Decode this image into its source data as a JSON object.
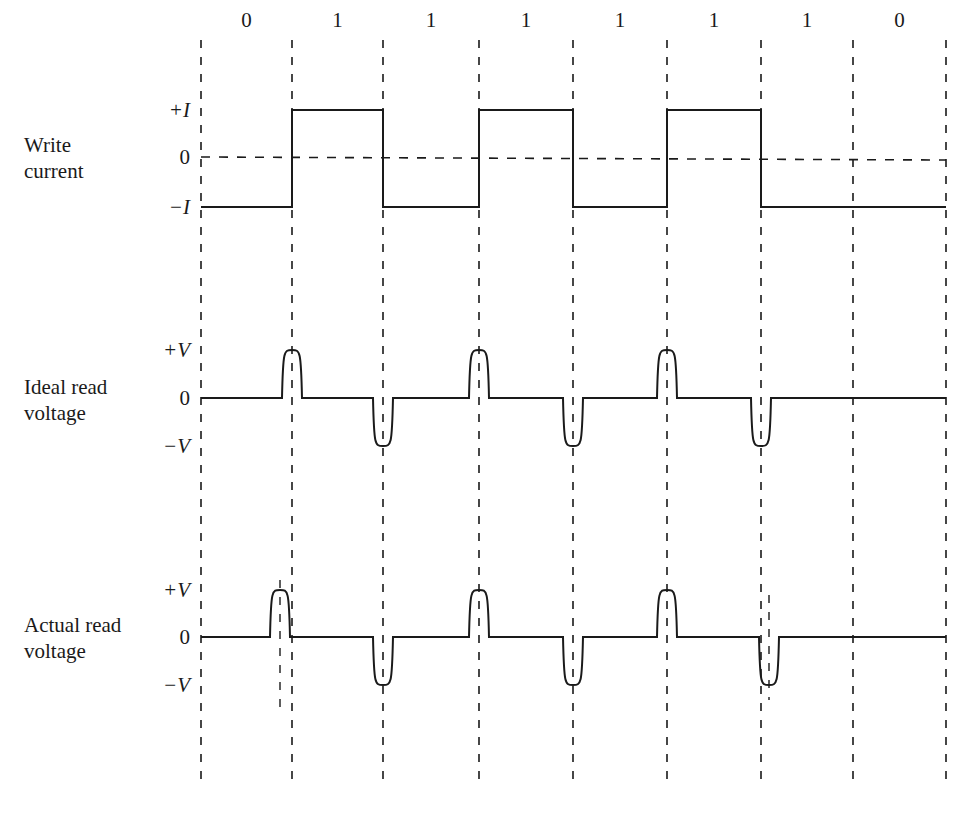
{
  "diagram": {
    "type": "timing-diagram",
    "bits": [
      "0",
      "1",
      "1",
      "1",
      "1",
      "1",
      "1",
      "0"
    ],
    "grid_x": [
      201,
      292,
      383,
      479,
      573,
      667,
      761,
      853,
      946
    ],
    "grid_top": 40,
    "grid_bottom": 780,
    "line_color": "#1a1a1a",
    "signals": [
      {
        "name_line1": "Write",
        "name_line2": "current",
        "levels": {
          "pos": "+I",
          "zero": "0",
          "neg": "−I"
        },
        "y": {
          "pos": 110,
          "zero": 157,
          "neg": 207
        },
        "states": [
          "neg",
          "pos",
          "neg",
          "pos",
          "neg",
          "pos",
          "neg",
          "neg"
        ]
      },
      {
        "name_line1": "Ideal read",
        "name_line2": "voltage",
        "levels": {
          "pos": "+V",
          "zero": "0",
          "neg": "−V"
        },
        "y": {
          "pos": 350,
          "zero": 398,
          "neg": 446
        },
        "pulses": [
          {
            "x": 292,
            "dir": "pos"
          },
          {
            "x": 383,
            "dir": "neg"
          },
          {
            "x": 479,
            "dir": "pos"
          },
          {
            "x": 573,
            "dir": "neg"
          },
          {
            "x": 667,
            "dir": "pos"
          },
          {
            "x": 761,
            "dir": "neg"
          }
        ]
      },
      {
        "name_line1": "Actual read",
        "name_line2": "voltage",
        "levels": {
          "pos": "+V",
          "zero": "0",
          "neg": "−V"
        },
        "y": {
          "pos": 590,
          "zero": 637,
          "neg": 685
        },
        "pulses": [
          {
            "x": 280,
            "dir": "pos",
            "shifted": true
          },
          {
            "x": 383,
            "dir": "neg"
          },
          {
            "x": 479,
            "dir": "pos"
          },
          {
            "x": 573,
            "dir": "neg"
          },
          {
            "x": 667,
            "dir": "pos"
          },
          {
            "x": 769,
            "dir": "neg",
            "shifted": true
          }
        ],
        "shift_markers": [
          {
            "x": 280,
            "y1": 580,
            "y2": 715
          },
          {
            "x": 769,
            "y1": 595,
            "y2": 700
          }
        ]
      }
    ]
  }
}
